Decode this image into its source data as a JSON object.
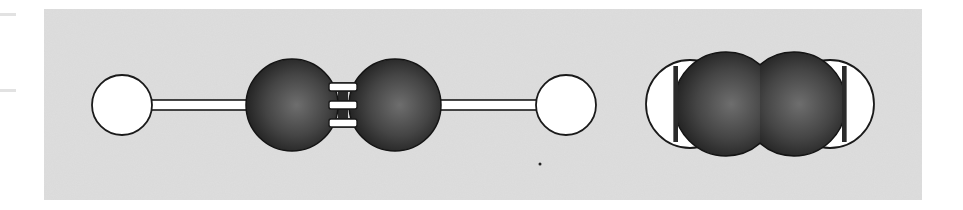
{
  "figure": {
    "panel_color": "#dedede",
    "models": [
      {
        "name": "ball-and-stick",
        "atoms": [
          {
            "element": "H",
            "cx": 122,
            "cy": 105,
            "r": 30,
            "color": "#ffffff"
          },
          {
            "element": "C",
            "cx": 292,
            "cy": 105,
            "r": 46,
            "color": "#3a3a3a"
          },
          {
            "element": "C",
            "cx": 395,
            "cy": 105,
            "r": 46,
            "color": "#3a3a3a"
          },
          {
            "element": "H",
            "cx": 566,
            "cy": 105,
            "r": 30,
            "color": "#ffffff"
          }
        ],
        "bonds": [
          {
            "type": "single",
            "from": "H",
            "to": "C"
          },
          {
            "type": "triple",
            "from": "C",
            "to": "C"
          },
          {
            "type": "single",
            "from": "C",
            "to": "H"
          }
        ]
      },
      {
        "name": "space-filling",
        "atoms": [
          {
            "element": "H",
            "cx": 690,
            "cy": 104,
            "r": 44,
            "color": "#ffffff"
          },
          {
            "element": "C",
            "cx": 726,
            "cy": 104,
            "r": 52,
            "color": "#3a3a3a"
          },
          {
            "element": "C",
            "cx": 794,
            "cy": 104,
            "r": 52,
            "color": "#3a3a3a"
          },
          {
            "element": "H",
            "cx": 830,
            "cy": 104,
            "r": 44,
            "color": "#ffffff"
          }
        ]
      }
    ]
  }
}
